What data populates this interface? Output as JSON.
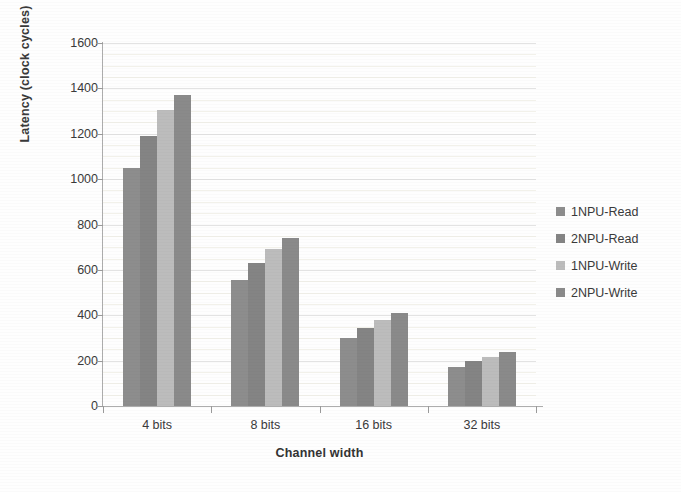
{
  "chart_data": {
    "type": "bar",
    "title": "",
    "xlabel": "Channel width",
    "ylabel": "Latency (clock cycles)",
    "categories": [
      "4 bits",
      "8 bits",
      "16 bits",
      "32 bits"
    ],
    "series": [
      {
        "name": "1NPU-Read",
        "color": "#8d8d8d",
        "values": [
          1050,
          555,
          300,
          172
        ]
      },
      {
        "name": "2NPU-Read",
        "color": "#848484",
        "values": [
          1190,
          630,
          342,
          200
        ]
      },
      {
        "name": "1NPU-Write",
        "color": "#bcbcbc",
        "values": [
          1305,
          690,
          377,
          218
        ]
      },
      {
        "name": "2NPU-Write",
        "color": "#8a8a8a",
        "values": [
          1370,
          740,
          408,
          240
        ]
      }
    ],
    "ylim": [
      0,
      1600
    ],
    "yticks": [
      0,
      200,
      400,
      600,
      800,
      1000,
      1200,
      1400,
      1600
    ],
    "ytick_labels": [
      "0",
      "200",
      "400",
      "600",
      "800",
      "1000",
      "1200",
      "1400",
      "1600"
    ],
    "minor_ytick_step": 50,
    "grid": true,
    "grid_axis": "y",
    "legend_position": "right",
    "bar_width_px": 17,
    "group_width_px": 95,
    "plot_bg": "#ffffff",
    "grid_color": "#e3e3e3",
    "axis_color": "#adadad",
    "text_color": "#3a3a3a"
  }
}
